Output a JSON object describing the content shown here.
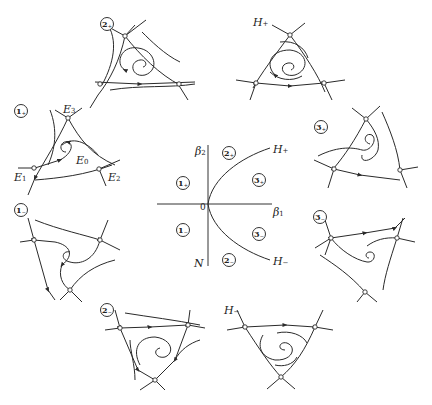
{
  "figure": {
    "header_text": "",
    "center_diagram": {
      "axis_x_label": "β",
      "axis_x_sub": "1",
      "axis_y_label": "β",
      "axis_y_sub": "2",
      "origin_label": "0",
      "N_label": "N",
      "H_plus_label": "H",
      "H_plus_sub": "+",
      "H_minus_label": "H",
      "H_minus_sub": "−",
      "regions": [
        {
          "id": "1+",
          "num": "1",
          "sign": "+"
        },
        {
          "id": "2+",
          "num": "2",
          "sign": "+"
        },
        {
          "id": "3+",
          "num": "3",
          "sign": "+"
        },
        {
          "id": "1-",
          "num": "1",
          "sign": "−"
        },
        {
          "id": "2-",
          "num": "2",
          "sign": "−"
        },
        {
          "id": "3-",
          "num": "3",
          "sign": "−"
        }
      ]
    },
    "portraits": [
      {
        "id": "1+",
        "num": "1",
        "sign": "+",
        "equilibria": [
          "E1",
          "E2",
          "E3",
          "E0"
        ]
      },
      {
        "id": "2+",
        "num": "2",
        "sign": "+"
      },
      {
        "id": "H+",
        "label": "H",
        "sub": "+"
      },
      {
        "id": "3+",
        "num": "3",
        "sign": "+"
      },
      {
        "id": "3-",
        "num": "3",
        "sign": "−"
      },
      {
        "id": "H-",
        "label": "H",
        "sub": "−"
      },
      {
        "id": "2-",
        "num": "2",
        "sign": "−"
      },
      {
        "id": "1-",
        "num": "1",
        "sign": "−"
      }
    ],
    "equilibrium_labels": {
      "E0": {
        "name": "E",
        "sub": "0"
      },
      "E1": {
        "name": "E",
        "sub": "1"
      },
      "E2": {
        "name": "E",
        "sub": "2"
      },
      "E3": {
        "name": "E",
        "sub": "3"
      }
    }
  }
}
